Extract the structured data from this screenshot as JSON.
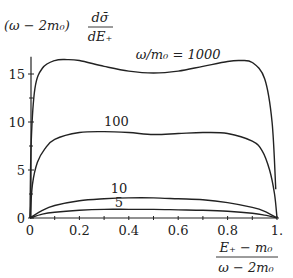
{
  "chart_data": {
    "type": "line",
    "title": "",
    "ylabel": "(ω − 2m₀) dσ̄/dE₊",
    "ylabel_parts": {
      "prefix": "(ω − 2m₀)",
      "num": "dσ̄",
      "den": "dE₊"
    },
    "xlabel": "(E₊ − m₀)/(ω − 2m₀)",
    "xlabel_parts": {
      "num": "E₊ − m₀",
      "den": "ω − 2m₀"
    },
    "xlim": [
      0,
      1
    ],
    "ylim": [
      0,
      17
    ],
    "x_ticks": [
      "0",
      "0.2",
      "0.4",
      "0.6",
      "0.8",
      "1."
    ],
    "y_ticks": [
      "0",
      "5",
      "10",
      "15"
    ],
    "grid": false,
    "series": [
      {
        "name": "ω/m₀ = 1000",
        "label": "ω/m₀ = 1000",
        "x": [
          0,
          0.005,
          0.02,
          0.05,
          0.1,
          0.15,
          0.2,
          0.3,
          0.4,
          0.5,
          0.6,
          0.7,
          0.8,
          0.85,
          0.9,
          0.95,
          0.98,
          0.995
        ],
        "values": [
          0,
          8,
          13.5,
          15.6,
          16.4,
          16.5,
          16.4,
          15.8,
          15.3,
          15.1,
          15.3,
          15.8,
          16.3,
          16.4,
          16.2,
          14.5,
          10,
          3
        ]
      },
      {
        "name": "100",
        "label": "100",
        "x": [
          0,
          0.01,
          0.03,
          0.06,
          0.1,
          0.2,
          0.3,
          0.4,
          0.5,
          0.6,
          0.7,
          0.8,
          0.9,
          0.94,
          0.97,
          0.99,
          1.0
        ],
        "values": [
          0,
          3.5,
          5.8,
          7.2,
          8.2,
          8.9,
          9.0,
          8.9,
          8.7,
          8.8,
          8.9,
          8.8,
          8.0,
          7.0,
          5.0,
          2.5,
          0
        ]
      },
      {
        "name": "10",
        "label": "10",
        "x": [
          0,
          0.05,
          0.1,
          0.2,
          0.3,
          0.4,
          0.5,
          0.6,
          0.7,
          0.8,
          0.9,
          0.95,
          1.0
        ],
        "values": [
          0,
          0.8,
          1.3,
          1.8,
          2.0,
          2.1,
          2.1,
          2.0,
          1.9,
          1.6,
          1.1,
          0.7,
          0
        ]
      },
      {
        "name": "5",
        "label": "5",
        "x": [
          0,
          0.05,
          0.1,
          0.2,
          0.3,
          0.4,
          0.5,
          0.6,
          0.7,
          0.8,
          0.9,
          0.95,
          1.0
        ],
        "values": [
          0,
          0.4,
          0.6,
          0.8,
          0.9,
          0.9,
          0.9,
          0.85,
          0.8,
          0.7,
          0.5,
          0.3,
          0
        ]
      }
    ],
    "annotations": [
      {
        "text": "ω/m₀ = 1000",
        "x": 0.6,
        "y": 16.6
      },
      {
        "text": "100",
        "x": 0.35,
        "y": 9.6
      },
      {
        "text": "10",
        "x": 0.36,
        "y": 2.6
      },
      {
        "text": "5",
        "x": 0.36,
        "y": 1.1
      }
    ]
  }
}
